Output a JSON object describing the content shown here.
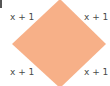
{
  "diagram": {
    "shape": "square rotated 45° (rhombus)",
    "fill_color": "#F7B088",
    "labels": {
      "top_left": "x + 1",
      "top_right": "x + 1",
      "bottom_left": "x + 1",
      "bottom_right": "x + 1"
    }
  }
}
